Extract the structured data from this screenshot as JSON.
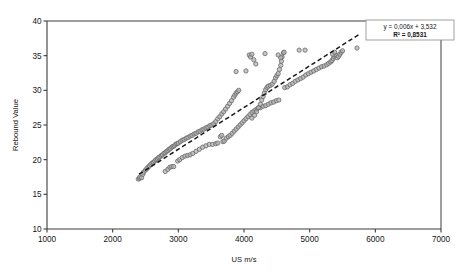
{
  "chart": {
    "title": "",
    "xlabel": "US m/s",
    "ylabel": "Rebound Value",
    "equation_line1": "y = 0,006x + 3,532",
    "equation_line2": "R² = 0,8531",
    "marker_fill": "#b3b3b3",
    "marker_stroke": "#6e6e6e",
    "trendline_color": "#1a1a1a",
    "axis_color": "#3c3c3c",
    "background": "#ffffff"
  },
  "chart_data": {
    "type": "scatter",
    "title": "",
    "xlabel": "US m/s",
    "ylabel": "Rebound Value",
    "xlim": [
      1000,
      7000
    ],
    "ylim": [
      10,
      40
    ],
    "xticks": [
      1000,
      2000,
      3000,
      4000,
      5000,
      6000,
      7000
    ],
    "yticks": [
      10,
      15,
      20,
      25,
      30,
      35,
      40
    ],
    "grid": false,
    "legend": false,
    "annotations": [
      {
        "text": "y = 0,006x + 3,532",
        "bold": false
      },
      {
        "text": "R² = 0,8531",
        "bold": true
      }
    ],
    "trendline": {
      "type": "linear",
      "style": "dashed",
      "slope": 0.006,
      "intercept": 3.532,
      "r_squared": 0.8531,
      "x_start": 2400,
      "x_end": 5760,
      "y_start": 17.9,
      "y_end": 38.1
    },
    "series": [
      {
        "name": "Rebound Value vs US m/s",
        "marker": "open-circle",
        "points": [
          [
            2390,
            17.2
          ],
          [
            2410,
            17.3
          ],
          [
            2415,
            17.5
          ],
          [
            2440,
            17.4
          ],
          [
            2460,
            17.9
          ],
          [
            2470,
            18.2
          ],
          [
            2500,
            18.5
          ],
          [
            2520,
            18.7
          ],
          [
            2540,
            18.9
          ],
          [
            2560,
            19.1
          ],
          [
            2580,
            19.3
          ],
          [
            2600,
            19.5
          ],
          [
            2620,
            19.6
          ],
          [
            2640,
            19.8
          ],
          [
            2660,
            20.0
          ],
          [
            2680,
            20.1
          ],
          [
            2700,
            20.3
          ],
          [
            2720,
            20.4
          ],
          [
            2740,
            20.6
          ],
          [
            2760,
            20.7
          ],
          [
            2780,
            20.9
          ],
          [
            2800,
            21.0
          ],
          [
            2820,
            21.2
          ],
          [
            2840,
            21.3
          ],
          [
            2860,
            21.5
          ],
          [
            2880,
            21.6
          ],
          [
            2900,
            21.8
          ],
          [
            2920,
            21.9
          ],
          [
            2940,
            22.0
          ],
          [
            2960,
            22.2
          ],
          [
            2980,
            22.3
          ],
          [
            3000,
            22.4
          ],
          [
            3030,
            22.6
          ],
          [
            3060,
            22.8
          ],
          [
            3090,
            22.9
          ],
          [
            3120,
            23.1
          ],
          [
            3150,
            23.2
          ],
          [
            3180,
            23.4
          ],
          [
            3210,
            23.5
          ],
          [
            3240,
            23.7
          ],
          [
            3270,
            23.8
          ],
          [
            3300,
            24.0
          ],
          [
            3330,
            24.1
          ],
          [
            3360,
            24.3
          ],
          [
            3390,
            24.4
          ],
          [
            3420,
            24.6
          ],
          [
            3450,
            24.7
          ],
          [
            3480,
            24.9
          ],
          [
            3510,
            25.0
          ],
          [
            3540,
            25.2
          ],
          [
            3570,
            25.5
          ],
          [
            3600,
            25.9
          ],
          [
            3630,
            26.2
          ],
          [
            3660,
            26.6
          ],
          [
            3690,
            26.9
          ],
          [
            3720,
            27.3
          ],
          [
            3750,
            27.7
          ],
          [
            3780,
            28.1
          ],
          [
            3810,
            28.5
          ],
          [
            3840,
            29.0
          ],
          [
            3860,
            29.3
          ],
          [
            3880,
            29.6
          ],
          [
            3900,
            29.8
          ],
          [
            3920,
            30.0
          ],
          [
            2800,
            18.3
          ],
          [
            2840,
            18.6
          ],
          [
            2870,
            18.9
          ],
          [
            2900,
            19.0
          ],
          [
            2930,
            19.0
          ],
          [
            2990,
            19.8
          ],
          [
            3020,
            20.0
          ],
          [
            3060,
            20.3
          ],
          [
            3100,
            20.5
          ],
          [
            3140,
            20.6
          ],
          [
            3180,
            20.7
          ],
          [
            3220,
            20.9
          ],
          [
            3270,
            21.2
          ],
          [
            3320,
            21.5
          ],
          [
            3370,
            21.8
          ],
          [
            3420,
            22.0
          ],
          [
            3470,
            22.2
          ],
          [
            3520,
            22.2
          ],
          [
            3570,
            22.3
          ],
          [
            3600,
            22.4
          ],
          [
            3640,
            23.3
          ],
          [
            3660,
            23.5
          ],
          [
            3680,
            22.6
          ],
          [
            3700,
            22.7
          ],
          [
            3730,
            23.1
          ],
          [
            3760,
            23.3
          ],
          [
            3790,
            23.5
          ],
          [
            3820,
            23.8
          ],
          [
            3850,
            24.1
          ],
          [
            3880,
            24.4
          ],
          [
            3910,
            24.7
          ],
          [
            3940,
            25.0
          ],
          [
            3970,
            25.3
          ],
          [
            4000,
            25.6
          ],
          [
            4030,
            25.9
          ],
          [
            4060,
            26.2
          ],
          [
            4090,
            26.5
          ],
          [
            4120,
            26.8
          ],
          [
            4150,
            27.0
          ],
          [
            4180,
            27.2
          ],
          [
            4210,
            27.4
          ],
          [
            4250,
            27.5
          ],
          [
            4290,
            27.7
          ],
          [
            4330,
            27.8
          ],
          [
            4370,
            28.0
          ],
          [
            4410,
            28.2
          ],
          [
            4450,
            28.3
          ],
          [
            4490,
            28.5
          ],
          [
            4530,
            28.6
          ],
          [
            4120,
            26.0
          ],
          [
            4160,
            26.4
          ],
          [
            4190,
            26.9
          ],
          [
            4220,
            27.5
          ],
          [
            4250,
            28.0
          ],
          [
            4270,
            28.6
          ],
          [
            4290,
            29.1
          ],
          [
            4310,
            29.6
          ],
          [
            4330,
            30.1
          ],
          [
            4350,
            30.4
          ],
          [
            4370,
            30.6
          ],
          [
            4400,
            30.7
          ],
          [
            4430,
            30.9
          ],
          [
            4460,
            31.3
          ],
          [
            4480,
            31.8
          ],
          [
            4500,
            32.1
          ],
          [
            4520,
            32.4
          ],
          [
            4540,
            33.0
          ],
          [
            4560,
            33.6
          ],
          [
            4570,
            34.2
          ],
          [
            4580,
            34.8
          ],
          [
            4600,
            35.4
          ],
          [
            4620,
            30.4
          ],
          [
            4660,
            30.5
          ],
          [
            4700,
            30.8
          ],
          [
            4740,
            31.0
          ],
          [
            4780,
            31.3
          ],
          [
            4820,
            31.5
          ],
          [
            4860,
            31.7
          ],
          [
            4900,
            31.9
          ],
          [
            4940,
            32.2
          ],
          [
            4980,
            32.4
          ],
          [
            5020,
            32.6
          ],
          [
            5060,
            32.8
          ],
          [
            5100,
            33.0
          ],
          [
            5140,
            33.2
          ],
          [
            5180,
            33.4
          ],
          [
            5220,
            33.5
          ],
          [
            5260,
            33.7
          ],
          [
            5290,
            33.9
          ],
          [
            5320,
            34.1
          ],
          [
            5340,
            34.3
          ],
          [
            5360,
            34.6
          ],
          [
            5380,
            34.9
          ],
          [
            5400,
            35.1
          ],
          [
            5420,
            34.7
          ],
          [
            5440,
            34.9
          ],
          [
            5460,
            35.2
          ],
          [
            5480,
            35.5
          ],
          [
            5500,
            35.7
          ],
          [
            5720,
            36.1
          ],
          [
            3880,
            32.7
          ],
          [
            4030,
            32.8
          ],
          [
            4080,
            35.1
          ],
          [
            4100,
            34.8
          ],
          [
            4120,
            35.2
          ],
          [
            4150,
            34.4
          ],
          [
            4180,
            33.8
          ],
          [
            4320,
            35.3
          ],
          [
            4520,
            35.1
          ],
          [
            4560,
            34.7
          ],
          [
            4610,
            35.5
          ],
          [
            4840,
            35.8
          ],
          [
            4930,
            35.8
          ],
          [
            5350,
            35.2
          ],
          [
            5380,
            35.5
          ]
        ]
      }
    ]
  }
}
